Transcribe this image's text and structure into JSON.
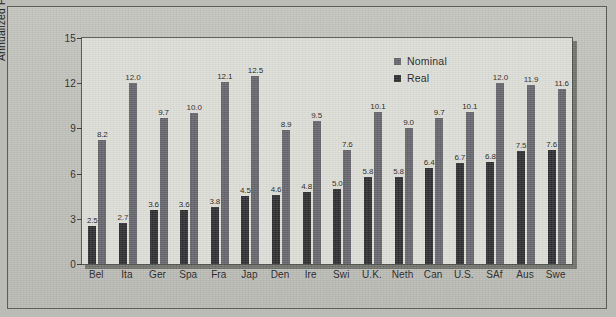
{
  "chart_data": {
    "type": "bar",
    "title": "",
    "xlabel": "",
    "ylabel": "Annualized Percentage Return",
    "ylim": [
      0,
      15
    ],
    "yticks": [
      "0",
      "3",
      "6",
      "9",
      "12",
      "15"
    ],
    "grid": false,
    "legend_position": "top-right",
    "categories": [
      "Bel",
      "Ita",
      "Ger",
      "Spa",
      "Fra",
      "Jap",
      "Den",
      "Ire",
      "Swi",
      "U.K.",
      "Neth",
      "Can",
      "U.S.",
      "SAf",
      "Aus",
      "Swe"
    ],
    "series": [
      {
        "name": "Real",
        "color": "#2c2c2e",
        "values": [
          2.5,
          2.7,
          3.6,
          3.6,
          3.8,
          4.5,
          4.6,
          4.8,
          5.0,
          5.8,
          5.8,
          6.4,
          6.7,
          6.8,
          7.5,
          7.6
        ],
        "labels": [
          "2.5",
          "2.7",
          "3.6",
          "3.6",
          "3.8",
          "4.5",
          "4.6",
          "4.8",
          "5.0",
          "5.8",
          "5.8",
          "6.4",
          "6.7",
          "6.8",
          "7.5",
          "7.6"
        ]
      },
      {
        "name": "Nominal",
        "color": "#63636a",
        "values": [
          8.2,
          12.0,
          9.7,
          10.0,
          12.1,
          12.5,
          8.9,
          9.5,
          7.6,
          10.1,
          9.0,
          9.7,
          10.1,
          12.0,
          11.9,
          11.6
        ],
        "labels": [
          "8.2",
          "12.0",
          "9.7",
          "10.0",
          "12.1",
          "12.5",
          "8.9",
          "9.5",
          "7.6",
          "10.1",
          "9.0",
          "9.7",
          "10.1",
          "12.0",
          "11.9",
          "11.6"
        ]
      }
    ]
  },
  "legend": {
    "entries": [
      {
        "label": "Nominal",
        "color": "#63636a"
      },
      {
        "label": "Real",
        "color": "#2c2c2e"
      }
    ]
  },
  "axis": {
    "y_title": "Annualized Percentage Return"
  }
}
